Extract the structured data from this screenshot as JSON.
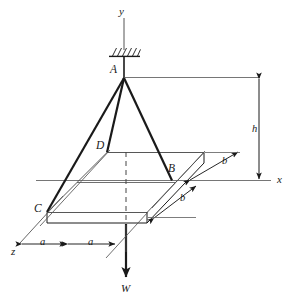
{
  "figure": {
    "type": "engineering-free-body-diagram",
    "stroke_color": "#1a1a1a",
    "background_color": "#ffffff"
  },
  "axes": {
    "y_label": "y",
    "x_label": "x",
    "z_label": "z"
  },
  "points": {
    "a": "A",
    "b": "B",
    "c": "C",
    "d": "D"
  },
  "dimensions": {
    "height": "h",
    "a_left": "a",
    "a_right": "a",
    "b_upper": "b",
    "b_lower": "b"
  },
  "load": {
    "weight_label": "W"
  }
}
